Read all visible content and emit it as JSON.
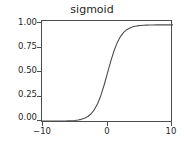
{
  "chart_data": {
    "type": "line",
    "title": "sigmoid",
    "xlabel": "",
    "ylabel": "",
    "xlim": [
      -10,
      10
    ],
    "ylim": [
      -0.02,
      1.04
    ],
    "grid": false,
    "legend": null,
    "line_color": "#4d4d4d",
    "xticks": [
      -10,
      0,
      10
    ],
    "xticklabels": [
      "−10",
      "0",
      "10"
    ],
    "yticks": [
      0.0,
      0.25,
      0.5,
      0.75,
      1.0
    ],
    "yticklabels": [
      "0.00",
      "0.25",
      "0.50",
      "0.75",
      "1.00"
    ],
    "series": [
      {
        "name": "sigmoid",
        "x": [
          -10,
          -9.5,
          -9,
          -8.5,
          -8,
          -7.5,
          -7,
          -6.5,
          -6,
          -5.5,
          -5,
          -4.5,
          -4,
          -3.5,
          -3,
          -2.5,
          -2,
          -1.5,
          -1,
          -0.5,
          0,
          0.5,
          1,
          1.5,
          2,
          2.5,
          3,
          3.5,
          4,
          4.5,
          5,
          5.5,
          6,
          6.5,
          7,
          7.5,
          8,
          8.5,
          9,
          9.5,
          10
        ],
        "y": [
          4.54e-05,
          7.49e-05,
          0.0001234,
          0.0002035,
          0.0003354,
          0.0005527,
          0.000911,
          0.0015011,
          0.0024726,
          0.0040701,
          0.0066929,
          0.011109,
          0.0179862,
          0.0293122,
          0.0474259,
          0.0758582,
          0.1192029,
          0.1824255,
          0.2689414,
          0.3775407,
          0.5,
          0.6224593,
          0.7310586,
          0.8175745,
          0.8807971,
          0.9241418,
          0.9525741,
          0.9706878,
          0.982014,
          0.9889071,
          0.9933071,
          0.9959299,
          0.9975274,
          0.9984989,
          0.999089,
          0.9994473,
          0.9996646,
          0.9997965,
          0.9998766,
          0.9999251,
          0.9999546
        ]
      }
    ]
  },
  "ticks": {
    "y": [
      {
        "label": "1.00",
        "top": 18
      },
      {
        "label": "0.75",
        "top": 42
      },
      {
        "label": "0.50",
        "top": 66
      },
      {
        "label": "0.25",
        "top": 90
      },
      {
        "label": "0.00",
        "top": 113
      }
    ],
    "y_marks": [
      22,
      47,
      71,
      96,
      120
    ],
    "x": [
      {
        "label": "−10",
        "left": 42
      },
      {
        "label": "0",
        "left": 107
      },
      {
        "label": "10",
        "left": 171
      }
    ],
    "x_marks": [
      42,
      107,
      171
    ]
  }
}
